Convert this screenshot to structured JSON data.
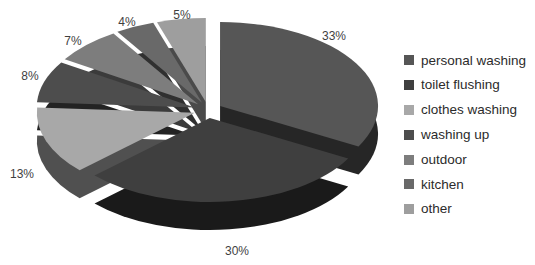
{
  "page": {
    "background_color": "#ffffff"
  },
  "chart_data": {
    "type": "pie",
    "style": "3d-exploded",
    "title": "",
    "categories": [
      "personal washing",
      "toilet flushing",
      "clothes washing",
      "washing up",
      "outdoor",
      "kitchen",
      "other"
    ],
    "values": [
      33,
      30,
      13,
      8,
      7,
      4,
      5
    ],
    "data_labels": [
      "33%",
      "30%",
      "13%",
      "8%",
      "7%",
      "4%",
      "5%"
    ],
    "colors": [
      "#565656",
      "#3f3f3f",
      "#a8a8a8",
      "#4d4d4d",
      "#7d7d7d",
      "#696969",
      "#9e9e9e"
    ],
    "side_colors": [
      "#262626",
      "#1a1a1a",
      "#505050",
      "#232323",
      "#3b3b3b",
      "#303030",
      "#4a4a4a"
    ],
    "label_color": "#3f3f3f",
    "legend_text_color": "#2b2b2b",
    "start_angle_deg": 0,
    "direction": "clockwise",
    "legend_position": "right",
    "grid": false
  }
}
